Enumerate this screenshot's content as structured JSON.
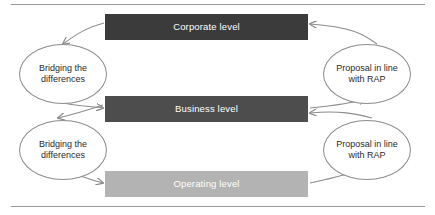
{
  "figure": {
    "title": "",
    "background_color": "#ffffff",
    "rule_color": "#9a9a9a",
    "arrow_color": "#8c8c8c",
    "ellipse_border_color": "#8c8c8c"
  },
  "levels": [
    {
      "id": "corporate",
      "label": "Corporate level",
      "color": "#3b3b3b",
      "text_color": "#ffffff"
    },
    {
      "id": "business",
      "label": "Business level",
      "color": "#4d4d4d",
      "text_color": "#ffffff"
    },
    {
      "id": "operating",
      "label": "Operating level",
      "color": "#b3b3b3",
      "text_color": "#ffffff"
    }
  ],
  "ellipses": [
    {
      "id": "left-top",
      "line1": "Bridging the",
      "line2": "differences"
    },
    {
      "id": "right-top",
      "line1": "Proposal in line",
      "line2": "with RAP"
    },
    {
      "id": "left-bottom",
      "line1": "Bridging the",
      "line2": "differences"
    },
    {
      "id": "right-bottom",
      "line1": "Proposal in line",
      "line2": "with RAP"
    }
  ],
  "flows": [
    {
      "from": "corporate",
      "to": "left-top",
      "meaning": "Bridging the differences"
    },
    {
      "from": "left-top",
      "to": "business",
      "meaning": "Bridging the differences"
    },
    {
      "from": "right-top",
      "to": "corporate",
      "meaning": "Proposal in line with RAP"
    },
    {
      "from": "business",
      "to": "right-top",
      "meaning": "Proposal in line with RAP"
    },
    {
      "from": "business",
      "to": "left-bottom",
      "meaning": "Bridging the differences"
    },
    {
      "from": "left-bottom",
      "to": "operating",
      "meaning": "Bridging the differences"
    },
    {
      "from": "right-bottom",
      "to": "business",
      "meaning": "Proposal in line with RAP"
    },
    {
      "from": "operating",
      "to": "right-bottom",
      "meaning": "Proposal in line with RAP"
    }
  ]
}
